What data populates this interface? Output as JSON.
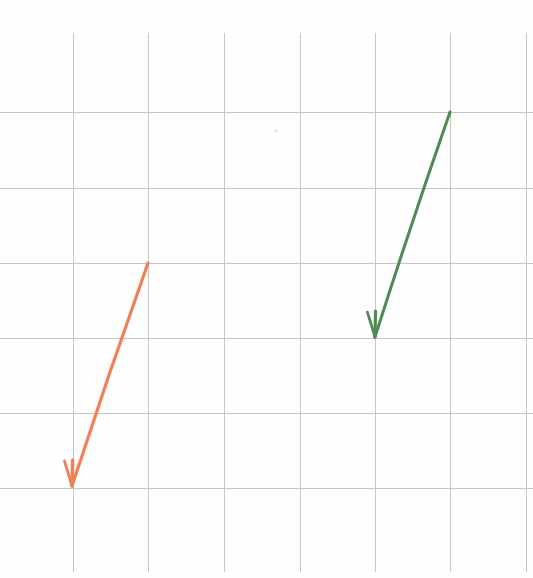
{
  "figure": {
    "kind": "hand-drawn-vector-diagram",
    "medium": "scanned graph paper",
    "width": 533,
    "height": 578,
    "background_color": "#fefefe"
  },
  "grid": {
    "name": "graph-paper-grid",
    "line_color": "#c6c6c6",
    "line_width": 1,
    "cell_size_px": 75.4,
    "vertical_lines_x": [
      73,
      148,
      224,
      300,
      375,
      450,
      526
    ],
    "horizontal_lines_y": [
      112,
      188,
      263,
      338,
      413,
      488
    ],
    "vertical_extent": {
      "y_start": 33,
      "y_end": 572
    },
    "horizontal_extent": {
      "x_start": 0,
      "x_end": 533
    }
  },
  "chart_data": {
    "type": "scatter",
    "title": "",
    "xlabel": "",
    "ylabel": "",
    "grid": true,
    "legend_position": "none",
    "annotations": [
      {
        "name": "orange-vector",
        "label": "",
        "color": "#ef8055",
        "stroke_width": 3.2,
        "start_px": [
          148,
          263
        ],
        "end_px": [
          72,
          486
        ],
        "delta_px": [
          -76,
          223
        ],
        "grid_cells": [
          -1,
          3
        ],
        "length_px": 235.6,
        "angle_deg": -71.2,
        "arrowhead": "open-v",
        "arrowhead_barb_len_px": 26
      },
      {
        "name": "green-vector",
        "label": "",
        "color": "#4f8a50",
        "stroke_width": 3.0,
        "start_px": [
          450,
          112
        ],
        "end_px": [
          375,
          337
        ],
        "delta_px": [
          -75,
          225
        ],
        "grid_cells": [
          -1,
          3
        ],
        "length_px": 237.2,
        "angle_deg": -71.6,
        "arrowhead": "open-v",
        "arrowhead_barb_len_px": 26
      }
    ],
    "speck": {
      "name": "paper-speck",
      "center_px": [
        276,
        131
      ],
      "radius_px": 1.6,
      "color": "#d8d8d8"
    }
  }
}
